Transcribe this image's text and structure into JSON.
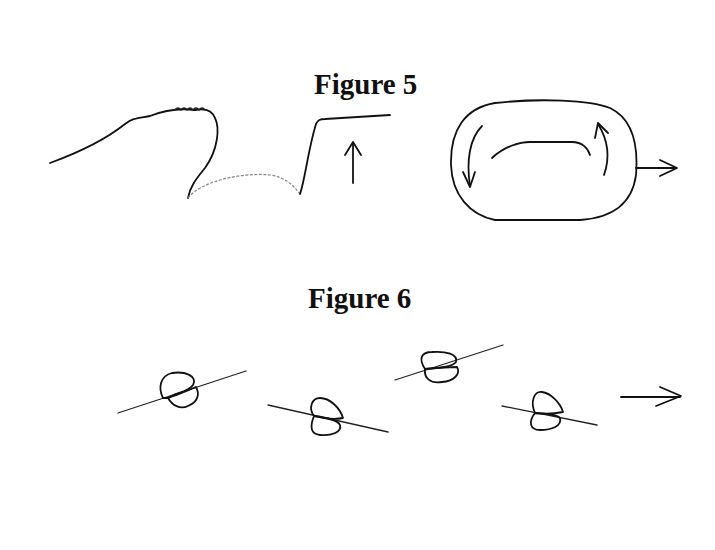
{
  "figures": [
    {
      "title": "Figure 5",
      "panels": [
        {
          "name": "wave-profile",
          "elements": [
            "wave-line",
            "upward-arrow"
          ]
        },
        {
          "name": "oval-circulation",
          "elements": [
            "oval-outline",
            "inner-arc",
            "down-arrow-left",
            "up-arrow-right",
            "rightward-arrow"
          ]
        }
      ]
    },
    {
      "title": "Figure 6",
      "panels": [
        {
          "name": "particle-sequence",
          "count": 4,
          "elements": [
            "particle-on-line"
          ]
        },
        {
          "name": "direction",
          "elements": [
            "rightward-arrow"
          ]
        }
      ]
    }
  ],
  "colors": {
    "ink": "#111111",
    "background": "#ffffff"
  }
}
